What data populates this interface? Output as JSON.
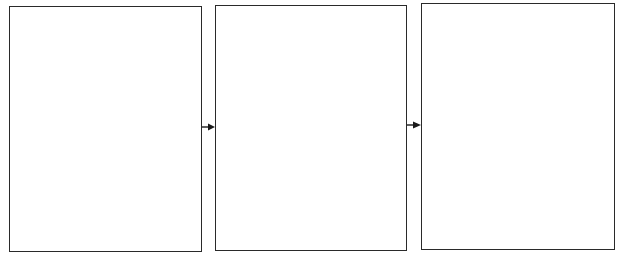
{
  "diagram": {
    "type": "flow",
    "boxes": [
      {
        "id": "box-1",
        "label": ""
      },
      {
        "id": "box-2",
        "label": ""
      },
      {
        "id": "box-3",
        "label": ""
      }
    ],
    "arrows": [
      {
        "from": "box-1",
        "to": "box-2"
      },
      {
        "from": "box-2",
        "to": "box-3"
      }
    ],
    "colors": {
      "stroke": "#2a2a2a",
      "background": "#ffffff"
    }
  }
}
